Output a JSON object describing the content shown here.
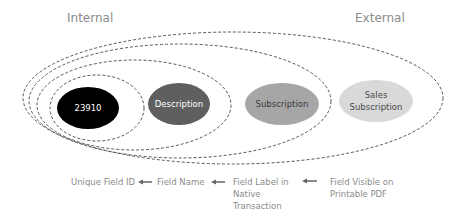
{
  "headers": {
    "internal": "Internal",
    "external": "External"
  },
  "nodes": [
    {
      "id": "unique-field-id",
      "lines": [
        "23910"
      ],
      "fill": "#000000",
      "text_color": "#ffffff"
    },
    {
      "id": "field-name",
      "lines": [
        "Description"
      ],
      "fill": "#5f5f5f",
      "text_color": "#ffffff"
    },
    {
      "id": "field-label",
      "lines": [
        "Subscription"
      ],
      "fill": "#a6a6a6",
      "text_color": "#3a3a3a"
    },
    {
      "id": "field-visible",
      "lines": [
        "Sales",
        "Subscription"
      ],
      "fill": "#d9d9d9",
      "text_color": "#4a4a4a"
    }
  ],
  "captions": {
    "unique_field_id": "Unique Field ID",
    "field_name": "Field Name",
    "field_label_line1": "Field Label in",
    "field_label_line2": "Native",
    "field_label_line3": "Transaction",
    "field_visible_line1": "Field Visible on",
    "field_visible_line2": "Printable PDF"
  },
  "arrows": [
    "left-arrow",
    "left-arrow",
    "left-arrow"
  ],
  "colors": {
    "text_gray": "#8c8c8c",
    "dashed_outline": "#555555"
  }
}
